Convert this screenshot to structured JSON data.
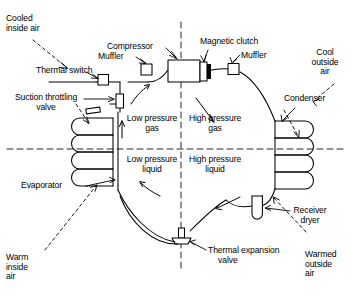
{
  "diagram": {
    "type": "schematic",
    "colors": {
      "line": "#000000",
      "dashed_axis": "#000000",
      "background": "#ffffff"
    },
    "axes": {
      "vertical_divider_label": "low-pressure / high-pressure side divider",
      "horizontal_divider_label": "gas / liquid state divider"
    },
    "quadrants": [
      {
        "id": "q-low-gas",
        "line1": "Low pressure",
        "line2": "gas"
      },
      {
        "id": "q-high-gas",
        "line1": "High pressure",
        "line2": "gas"
      },
      {
        "id": "q-low-liquid",
        "line1": "Low pressure",
        "line2": "liquid"
      },
      {
        "id": "q-high-liquid",
        "line1": "High pressure",
        "line2": "liquid"
      }
    ],
    "components": [
      {
        "id": "compressor",
        "label": "Compressor"
      },
      {
        "id": "magnetic-clutch",
        "label": "Magnetic clutch"
      },
      {
        "id": "muffler-suction",
        "label": "Muffler"
      },
      {
        "id": "muffler-discharge",
        "label": "Muffler"
      },
      {
        "id": "thermal-switch",
        "label": "Thermal switch"
      },
      {
        "id": "suction-throttling-valve",
        "label": "Suction throttling\nvalve"
      },
      {
        "id": "evaporator",
        "label": "Evaporator"
      },
      {
        "id": "condenser",
        "label": "Condenser"
      },
      {
        "id": "receiver-dryer",
        "label": "Receiver\ndryer"
      },
      {
        "id": "thermal-expansion-valve",
        "label": "Thermal expansion\nvalve"
      }
    ],
    "airflow_labels": [
      {
        "id": "cooled-inside-air",
        "line1": "Cooled",
        "line2": "inside air"
      },
      {
        "id": "cool-outside-air",
        "line1": "Cool",
        "line2": "outside",
        "line3": "air"
      },
      {
        "id": "warm-inside-air",
        "line1": "Warm",
        "line2": "inside",
        "line3": "air"
      },
      {
        "id": "warmed-outside-air",
        "line1": "Warmed",
        "line2": "outside",
        "line3": "air"
      }
    ]
  }
}
